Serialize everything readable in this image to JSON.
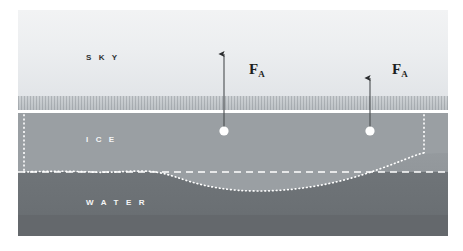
{
  "figure": {
    "width": 463,
    "height": 251
  },
  "layers": [
    {
      "id": "sky",
      "label": "S K Y",
      "color": "#eceef0",
      "text_color": "#2e3133"
    },
    {
      "id": "ice",
      "label": "I C E",
      "color": "#969b9f",
      "text_color": "#f4f5f6"
    },
    {
      "id": "water",
      "label": "W A T E R",
      "color": "#6b7074",
      "text_color": "#f4f5f6"
    }
  ],
  "labels": {
    "sky": "S K Y",
    "ice": "I C E",
    "water": "W A T E R"
  },
  "forces": [
    {
      "id": "force-left",
      "symbol": "F",
      "subscript": "A",
      "x": 224,
      "tip_y": 52,
      "base_y": 128
    },
    {
      "id": "force-right",
      "symbol": "F",
      "subscript": "A",
      "x": 370,
      "tip_y": 76,
      "base_y": 128
    }
  ],
  "force_symbol": "F",
  "force_subscript": "A",
  "markers": [
    {
      "id": "center-of-mass-left",
      "x": 224,
      "y": 128,
      "radius": 5,
      "color": "#ffffff"
    },
    {
      "id": "center-of-mass-right",
      "x": 370,
      "y": 128,
      "radius": 5,
      "color": "#ffffff"
    }
  ],
  "guides": {
    "waterline_label": "waterline",
    "waterline_style": "dashed",
    "keel_style": "dotted",
    "ice_outline_style": "dotted",
    "line_color": "#ffffff"
  },
  "colors": {
    "sky_top": "#f2f3f4",
    "sky_bottom": "#e2e5e8",
    "horizon_band": "#bdc2c6",
    "surface_line": "#ffffff",
    "ice": "#969b9f",
    "water": "#6b7074",
    "water_deep": "#64686c",
    "guide_line": "#ffffff",
    "label_dark": "#2e3133",
    "label_light": "#f4f5f6",
    "arrow": "#2a2c2e",
    "background": "#ffffff"
  }
}
